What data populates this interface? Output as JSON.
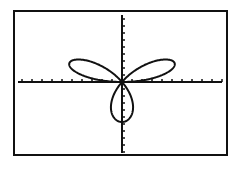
{
  "chart_data": {
    "type": "line",
    "title": "",
    "xlabel": "",
    "ylabel": "",
    "equation": "r = sin(3θ)",
    "mode": "polar",
    "petals": 3,
    "petal_directions_deg": [
      30,
      150,
      270
    ],
    "amplitude": 1,
    "xlim": [
      -1.75,
      1.67
    ],
    "ylim": [
      -1.77,
      1.68
    ],
    "grid": false,
    "axes": true,
    "x_tick_count_each_side": 10,
    "y_tick_count_above": 9,
    "y_tick_count_below": 10,
    "legend": null,
    "series": [
      {
        "name": "r = sin(3θ)",
        "theta_range_deg": [
          0,
          180
        ],
        "color": "#111111"
      }
    ]
  },
  "layout": {
    "frame": {
      "left": 14,
      "top": 11,
      "right": 227,
      "bottom": 155
    },
    "origin_px": [
      122,
      82
    ],
    "x_px_per_unit": 60,
    "y_px_per_unit": 40,
    "x_tick_spacing_px": 10,
    "y_tick_spacing_px": 7,
    "x_axis_px": [
      18,
      222
    ],
    "y_axis_px": [
      15,
      153
    ],
    "colors": {
      "ink": "#111111",
      "background": "#ffffff"
    }
  }
}
